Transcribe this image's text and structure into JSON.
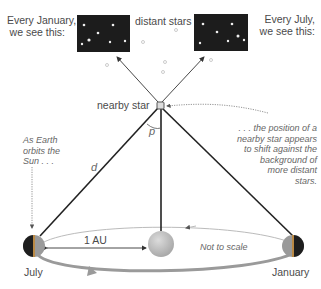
{
  "labels": {
    "january_caption": [
      "Every January,",
      "we see this:"
    ],
    "distant_stars": "distant stars",
    "july_caption": [
      "Every July,",
      "we see this:"
    ],
    "nearby_star": "nearby star",
    "parallax_angle": "p",
    "distance": "d",
    "as_earth": [
      "As Earth",
      "orbits the",
      "Sun . . ."
    ],
    "shift_note": [
      ". . . the position of a",
      "nearby star appears",
      "to shift against the",
      "background of",
      "more distant",
      "stars."
    ],
    "one_au": "1 AU",
    "not_to_scale": "Not to scale",
    "july": "July",
    "january": "January"
  },
  "colors": {
    "sky": "#1c1c1c",
    "line": "#222222",
    "orbit": "#999999",
    "sun": "#c4c4c4"
  }
}
